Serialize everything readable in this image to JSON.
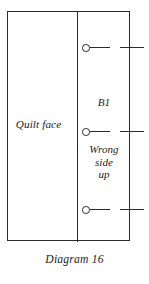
{
  "diagram": {
    "caption": "Diagram 16",
    "background_color": "#ffffff",
    "line_color": "#2b2b2b",
    "panels": {
      "left": {
        "label": "Quilt face"
      },
      "right": {
        "piece_label": "B1",
        "orientation_line_1": "Wrong",
        "orientation_line_2": "side",
        "orientation_line_3": "up"
      }
    },
    "markers": [
      {
        "name": "pin-marker-top",
        "glyph": "circle-with-line-and-tick"
      },
      {
        "name": "pin-marker-middle",
        "glyph": "circle-with-line-and-tick"
      },
      {
        "name": "pin-marker-bottom",
        "glyph": "circle-with-line-and-tick"
      }
    ]
  }
}
